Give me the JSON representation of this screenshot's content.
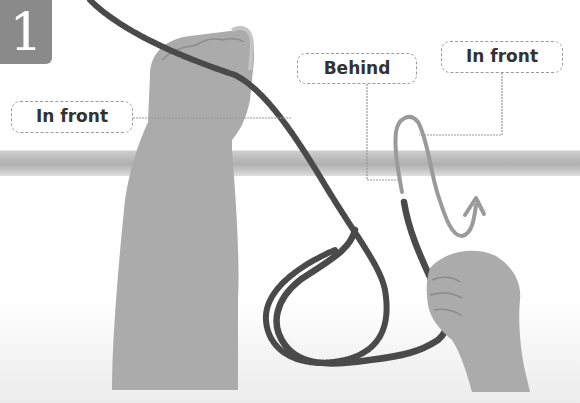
{
  "step": {
    "number": "1"
  },
  "labels": {
    "left": "In front",
    "behind": "Behind",
    "right": "In front"
  },
  "colors": {
    "badge": "#8a8a8a",
    "rope": "#4a4a4a",
    "guide_path": "#9a9a9a",
    "bar": "#bdbdbd",
    "skin": "#a9a9a9",
    "leader_line": "#999999"
  },
  "icons": {
    "guide_arrow": "arrow-up-icon"
  }
}
